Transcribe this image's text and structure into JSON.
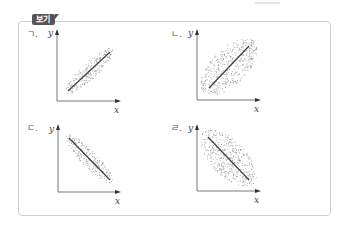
{
  "box": {
    "tag_label": "보기"
  },
  "panels": [
    {
      "id": "a",
      "label": "ㄱ.",
      "x_label": "x",
      "y_label": "y",
      "correlation": "positive",
      "spread": "narrow"
    },
    {
      "id": "b",
      "label": "ㄴ.",
      "x_label": "x",
      "y_label": "y",
      "correlation": "positive",
      "spread": "wide"
    },
    {
      "id": "c",
      "label": "ㄷ.",
      "x_label": "x",
      "y_label": "y",
      "correlation": "negative",
      "spread": "narrow"
    },
    {
      "id": "d",
      "label": "ㄹ.",
      "x_label": "x",
      "y_label": "y",
      "correlation": "negative",
      "spread": "wide"
    }
  ],
  "colors": {
    "axis": "#555555",
    "line": "#444444",
    "dots": "#777777",
    "tag_bg": "#555555",
    "border": "#cfcfcf"
  }
}
